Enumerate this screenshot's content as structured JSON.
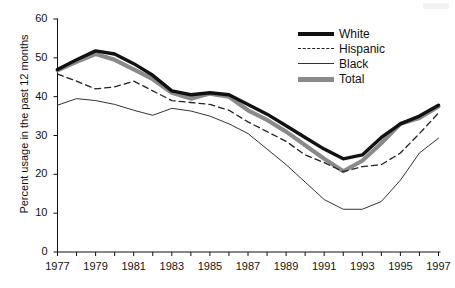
{
  "chart_data": {
    "type": "line",
    "title": "",
    "xlabel": "",
    "ylabel": "Percent usage in the past 12 months",
    "xlim": [
      1977,
      1997
    ],
    "ylim": [
      0,
      60
    ],
    "yticks": [
      0,
      10,
      20,
      30,
      40,
      50,
      60
    ],
    "xticks": [
      1977,
      1979,
      1981,
      1983,
      1985,
      1987,
      1989,
      1991,
      1993,
      1995,
      1997
    ],
    "xtick_labels": [
      "1977",
      "1979",
      "1981",
      "1983",
      "1985",
      "1987",
      "1989",
      "1991",
      "1993",
      "1995",
      "1997"
    ],
    "ytick_labels": [
      "0",
      "10",
      "20",
      "30",
      "40",
      "50",
      "60"
    ],
    "grid": false,
    "legend_position": "top-right",
    "x": [
      1977,
      1978,
      1979,
      1980,
      1981,
      1982,
      1983,
      1984,
      1985,
      1986,
      1987,
      1988,
      1989,
      1990,
      1991,
      1992,
      1993,
      1994,
      1995,
      1996,
      1997
    ],
    "series": [
      {
        "name": "White",
        "style": "thick-solid-black",
        "color": "#111111",
        "values": [
          47.0,
          49.5,
          51.8,
          51.0,
          48.5,
          45.5,
          41.5,
          40.5,
          41.0,
          40.5,
          38.0,
          35.5,
          32.5,
          29.5,
          26.5,
          24.0,
          25.0,
          29.5,
          33.0,
          35.0,
          37.8
        ]
      },
      {
        "name": "Hispanic",
        "style": "dashed",
        "color": "#222222",
        "values": [
          45.8,
          44.0,
          42.0,
          42.5,
          44.0,
          41.5,
          39.0,
          38.5,
          38.0,
          36.5,
          33.5,
          31.0,
          28.5,
          25.0,
          23.0,
          20.7,
          22.0,
          22.5,
          25.5,
          30.5,
          35.8
        ]
      },
      {
        "name": "Black",
        "style": "thin-solid",
        "color": "#333333",
        "values": [
          37.8,
          39.5,
          39.0,
          38.0,
          36.5,
          35.2,
          37.0,
          36.3,
          35.0,
          33.0,
          30.5,
          26.5,
          22.5,
          18.0,
          13.5,
          11.0,
          11.0,
          13.0,
          18.5,
          25.5,
          29.3
        ]
      },
      {
        "name": "Total",
        "style": "thick-solid-gray",
        "color": "#8a8a8a",
        "values": [
          46.8,
          49.0,
          51.0,
          49.5,
          47.0,
          44.5,
          41.0,
          39.5,
          40.8,
          40.0,
          36.5,
          34.0,
          31.0,
          27.5,
          24.0,
          20.8,
          23.5,
          28.0,
          33.0,
          34.5,
          37.5
        ]
      }
    ]
  },
  "legend": {
    "items": [
      {
        "label": "White"
      },
      {
        "label": "Hispanic"
      },
      {
        "label": "Black"
      },
      {
        "label": "Total"
      }
    ]
  }
}
